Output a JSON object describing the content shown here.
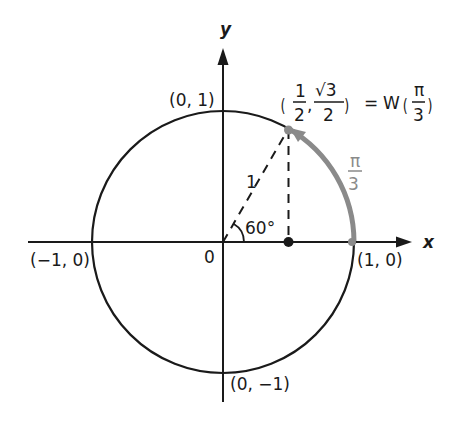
{
  "diagram": {
    "axes": {
      "x_label": "x",
      "y_label": "y",
      "origin_label": "0"
    },
    "circle_points": {
      "top": "(0, 1)",
      "bottom": "(0, −1)",
      "left": "(−1, 0)",
      "right": "(1, 0)"
    },
    "radius_label": "1",
    "angle_label": "60°",
    "arc_label": {
      "numerator": "π",
      "denominator": "3"
    },
    "point_label": {
      "x_num": "1",
      "x_den": "2",
      "comma": ",",
      "y_num": "√3",
      "y_den": "2",
      "equals": "=",
      "func": "W",
      "arg_num": "π",
      "arg_den": "3"
    },
    "colors": {
      "ink": "#1a1a1a",
      "arc_highlight": "#8a8a8a",
      "background": "#ffffff"
    }
  }
}
